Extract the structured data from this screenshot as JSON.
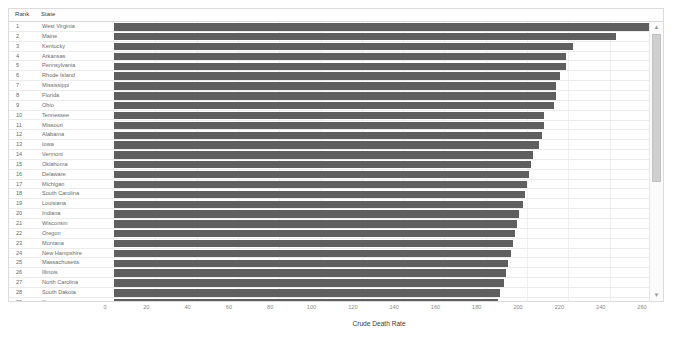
{
  "table": {
    "columns": [
      "Rank",
      "State"
    ]
  },
  "scrollbar": {
    "up_arrow": "▲",
    "down_arrow": "▼"
  },
  "chart_data": {
    "type": "bar",
    "orientation": "horizontal",
    "title": "",
    "xlabel": "Crude Death Rate",
    "ylabel": "",
    "xlim": [
      0,
      260
    ],
    "xticks": [
      0,
      20,
      40,
      60,
      80,
      100,
      120,
      140,
      160,
      180,
      200,
      220,
      240,
      260
    ],
    "grid": true,
    "legend": "none",
    "bar_color": "#5f5f5f",
    "categories": [
      "West Virginia",
      "Maine",
      "Kentucky",
      "Arkansas",
      "Pennsylvania",
      "Rhode Island",
      "Mississippi",
      "Florida",
      "Ohio",
      "Tennessee",
      "Missouri",
      "Alabama",
      "Iowa",
      "Vermont",
      "Oklahoma",
      "Delaware",
      "Michigan",
      "South Carolina",
      "Louisiana",
      "Indiana",
      "Wisconsin",
      "Oregon",
      "Montana",
      "New Hampshire",
      "Massachusetts",
      "Illinois",
      "North Carolina",
      "South Dakota",
      "Kansas"
    ],
    "ranks": [
      1,
      2,
      3,
      4,
      5,
      6,
      7,
      8,
      9,
      10,
      11,
      12,
      13,
      14,
      15,
      16,
      17,
      18,
      19,
      20,
      21,
      22,
      23,
      24,
      25,
      26,
      27,
      28,
      29
    ],
    "values": [
      263,
      243,
      222,
      219,
      219,
      216,
      214,
      214,
      213,
      208,
      208,
      207,
      206,
      203,
      202,
      201,
      200,
      199,
      198,
      196,
      195,
      194,
      193,
      192,
      191,
      190,
      189,
      187,
      186
    ]
  }
}
